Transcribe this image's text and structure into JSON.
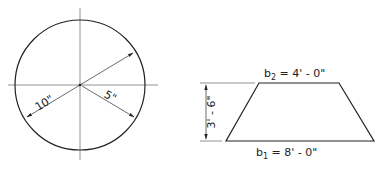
{
  "circle_figure": {
    "diameter_label": "10\"",
    "radius_label": "5\""
  },
  "trapezoid_figure": {
    "top_base_label": {
      "var": "b",
      "sub": "2",
      "value": " = 4' - 0\""
    },
    "bottom_base_label": {
      "var": "b",
      "sub": "1",
      "value": " = 8' - 0\""
    },
    "height_label": "3' - 6\""
  },
  "colors": {
    "line": "#222222",
    "centerline": "#777777",
    "background": "#ffffff"
  }
}
